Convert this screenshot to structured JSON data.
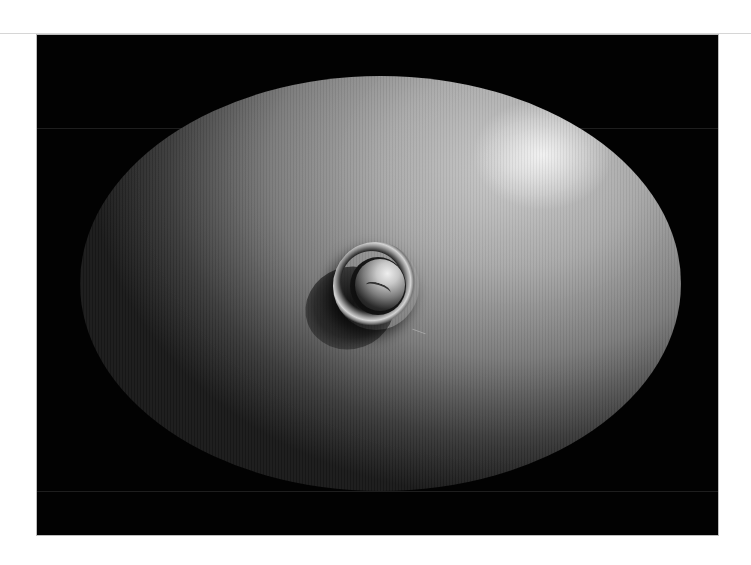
{
  "image": {
    "description": "Grayscale 3D-rendered ellipsoidal surface on a black background with a raised ring-shaped protrusion and central dome near the middle, lit from the upper right with a specular highlight.",
    "background_color": "#ffffff",
    "frame_color": "#020202",
    "surface_colors": {
      "highlight": "#eeeeee",
      "mid": "#9a9a9a",
      "shadow": "#1a1a1a"
    },
    "features": [
      "ellipsoid-surface",
      "specular-highlight",
      "ring-protrusion",
      "central-dome",
      "cast-shadow"
    ]
  }
}
